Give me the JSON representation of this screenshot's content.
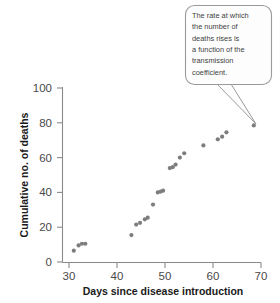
{
  "chart_data": {
    "type": "scatter",
    "title": "",
    "xlabel": "Days since disease introduction",
    "ylabel": "Cumulative no. of deaths",
    "xlim": [
      28,
      71
    ],
    "ylim": [
      0,
      103
    ],
    "xticks": [
      30,
      40,
      50,
      60,
      70
    ],
    "yticks": [
      0,
      20,
      40,
      60,
      80,
      100
    ],
    "xtick_labels": [
      "30",
      "40",
      "50",
      "60",
      "70"
    ],
    "ytick_labels": [
      "0",
      "20",
      "40",
      "60",
      "80",
      "100"
    ],
    "grid": false,
    "legend": null,
    "marker_color": "#7d7d7d",
    "marker_size": 4.2,
    "series": [
      {
        "name": "Cumulative deaths",
        "points": [
          [
            31.0,
            6.5
          ],
          [
            32.0,
            9.5
          ],
          [
            32.7,
            10.5
          ],
          [
            33.4,
            10.5
          ],
          [
            43.0,
            15.5
          ],
          [
            44.0,
            21.5
          ],
          [
            44.8,
            22.5
          ],
          [
            45.8,
            24.5
          ],
          [
            46.4,
            25.5
          ],
          [
            47.5,
            33.0
          ],
          [
            48.5,
            40.0
          ],
          [
            49.1,
            40.5
          ],
          [
            49.6,
            41.0
          ],
          [
            51.0,
            54.0
          ],
          [
            51.6,
            54.5
          ],
          [
            52.2,
            56.0
          ],
          [
            53.1,
            60.0
          ],
          [
            54.0,
            62.5
          ],
          [
            58.0,
            67.0
          ],
          [
            61.0,
            70.5
          ],
          [
            61.9,
            72.0
          ],
          [
            62.8,
            74.5
          ],
          [
            68.5,
            78.5
          ]
        ]
      }
    ],
    "annotations": [
      {
        "name": "transmission-coefficient-callout",
        "text": "The rate at which the number of deaths rises is a function of the transmission coefficient.",
        "lines": [
          "The rate at which",
          "the number of",
          "deaths rises is",
          "a function of the",
          "transmission",
          "coefficient."
        ],
        "points_to": [
          68.5,
          78.5
        ]
      }
    ]
  }
}
